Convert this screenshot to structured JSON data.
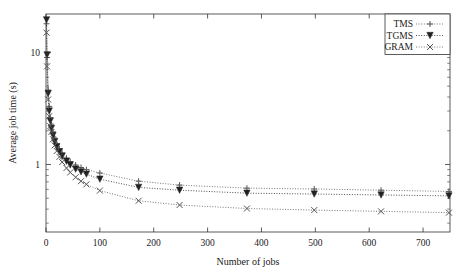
{
  "chart_data": {
    "type": "line",
    "title": "",
    "xlabel": "Number of jobs",
    "ylabel": "Average job time (s)",
    "xlim": [
      0,
      750
    ],
    "ylim": [
      0.25,
      22
    ],
    "yscale": "log",
    "xscale": "linear",
    "grid": false,
    "legend_position": "top-right",
    "xticks": [
      0,
      100,
      200,
      300,
      400,
      500,
      600,
      700
    ],
    "xticklabels": [
      "0",
      "100",
      "200",
      "300",
      "400",
      "500",
      "600",
      "700"
    ],
    "yticks": [
      1,
      10
    ],
    "yticklabels": [
      "1",
      "10"
    ],
    "series": [
      {
        "name": "TMS",
        "marker": "plus",
        "linestyle": "dotted",
        "color": "#555555",
        "points": [
          {
            "x": 1,
            "y": 18.0
          },
          {
            "x": 2,
            "y": 9.0
          },
          {
            "x": 4,
            "y": 4.6
          },
          {
            "x": 6,
            "y": 3.3
          },
          {
            "x": 8,
            "y": 2.6
          },
          {
            "x": 10,
            "y": 2.25
          },
          {
            "x": 13,
            "y": 1.95
          },
          {
            "x": 16,
            "y": 1.72
          },
          {
            "x": 20,
            "y": 1.52
          },
          {
            "x": 25,
            "y": 1.38
          },
          {
            "x": 30,
            "y": 1.26
          },
          {
            "x": 38,
            "y": 1.14
          },
          {
            "x": 45,
            "y": 1.06
          },
          {
            "x": 55,
            "y": 0.99
          },
          {
            "x": 65,
            "y": 0.94
          },
          {
            "x": 75,
            "y": 0.9
          },
          {
            "x": 100,
            "y": 0.84
          },
          {
            "x": 172,
            "y": 0.71
          },
          {
            "x": 248,
            "y": 0.655
          },
          {
            "x": 373,
            "y": 0.615
          },
          {
            "x": 498,
            "y": 0.605
          },
          {
            "x": 622,
            "y": 0.59
          },
          {
            "x": 748,
            "y": 0.575
          }
        ]
      },
      {
        "name": "TGMS",
        "marker": "triangle-down",
        "linestyle": "dotted",
        "color": "#222222",
        "points": [
          {
            "x": 1,
            "y": 19.5
          },
          {
            "x": 2,
            "y": 9.5
          },
          {
            "x": 4,
            "y": 4.3
          },
          {
            "x": 6,
            "y": 3.0
          },
          {
            "x": 8,
            "y": 2.45
          },
          {
            "x": 10,
            "y": 2.1
          },
          {
            "x": 13,
            "y": 1.82
          },
          {
            "x": 16,
            "y": 1.6
          },
          {
            "x": 20,
            "y": 1.44
          },
          {
            "x": 25,
            "y": 1.3
          },
          {
            "x": 30,
            "y": 1.19
          },
          {
            "x": 38,
            "y": 1.07
          },
          {
            "x": 45,
            "y": 0.99
          },
          {
            "x": 55,
            "y": 0.91
          },
          {
            "x": 65,
            "y": 0.86
          },
          {
            "x": 75,
            "y": 0.82
          },
          {
            "x": 100,
            "y": 0.74
          },
          {
            "x": 172,
            "y": 0.625
          },
          {
            "x": 248,
            "y": 0.59
          },
          {
            "x": 373,
            "y": 0.555
          },
          {
            "x": 498,
            "y": 0.545
          },
          {
            "x": 622,
            "y": 0.535
          },
          {
            "x": 748,
            "y": 0.525
          }
        ]
      },
      {
        "name": "GRAM",
        "marker": "cross",
        "linestyle": "dotted",
        "color": "#555555",
        "points": [
          {
            "x": 1,
            "y": 15.0
          },
          {
            "x": 2,
            "y": 7.5
          },
          {
            "x": 4,
            "y": 3.8
          },
          {
            "x": 6,
            "y": 2.7
          },
          {
            "x": 8,
            "y": 2.2
          },
          {
            "x": 10,
            "y": 1.95
          },
          {
            "x": 13,
            "y": 1.68
          },
          {
            "x": 16,
            "y": 1.48
          },
          {
            "x": 20,
            "y": 1.32
          },
          {
            "x": 25,
            "y": 1.17
          },
          {
            "x": 30,
            "y": 1.05
          },
          {
            "x": 38,
            "y": 0.93
          },
          {
            "x": 45,
            "y": 0.85
          },
          {
            "x": 55,
            "y": 0.77
          },
          {
            "x": 65,
            "y": 0.71
          },
          {
            "x": 75,
            "y": 0.665
          },
          {
            "x": 100,
            "y": 0.585
          },
          {
            "x": 172,
            "y": 0.475
          },
          {
            "x": 248,
            "y": 0.435
          },
          {
            "x": 373,
            "y": 0.405
          },
          {
            "x": 498,
            "y": 0.392
          },
          {
            "x": 622,
            "y": 0.382
          },
          {
            "x": 748,
            "y": 0.372
          }
        ]
      }
    ]
  },
  "legend": {
    "items": [
      {
        "label": "TMS"
      },
      {
        "label": "TGMS"
      },
      {
        "label": "GRAM"
      }
    ]
  }
}
